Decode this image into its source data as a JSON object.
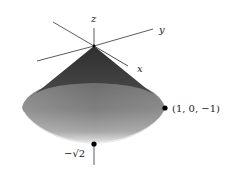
{
  "diagram": {
    "type": "3d-solid",
    "axes": {
      "z": {
        "label": "z"
      },
      "y": {
        "label": "y"
      },
      "x": {
        "label": "x"
      }
    },
    "points": [
      {
        "id": "rim-point",
        "label": "(1, 0, −1)"
      },
      {
        "id": "bottom-point",
        "label": "−√2"
      }
    ],
    "colors": {
      "cone_dark": "#3f3f3f",
      "bowl_mid": "#7a7a7a",
      "bowl_light": "#e6e6e6",
      "axis": "#333333",
      "point": "#000000"
    }
  }
}
